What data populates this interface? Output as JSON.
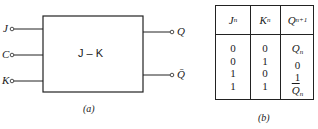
{
  "diagram_a": {
    "block_label": "J – K",
    "inputs": [
      {
        "label": "J"
      },
      {
        "label": "C"
      },
      {
        "label": "K"
      }
    ],
    "outputs": [
      {
        "label": "Q"
      },
      {
        "label": "Q̄"
      }
    ],
    "caption": "(a)"
  },
  "table_b": {
    "headers": [
      {
        "main": "J",
        "sub": "n"
      },
      {
        "main": "K",
        "sub": "n"
      },
      {
        "main": "Q",
        "sub": "n+1"
      }
    ],
    "rows": [
      {
        "j": "0",
        "k": "0",
        "q_main": "Q",
        "q_sub": "n",
        "q_bar": false
      },
      {
        "j": "0",
        "k": "1",
        "q_main": "0",
        "q_sub": "",
        "q_bar": false
      },
      {
        "j": "1",
        "k": "0",
        "q_main": "1",
        "q_sub": "",
        "q_bar": false
      },
      {
        "j": "1",
        "k": "1",
        "q_main": "Q",
        "q_sub": "n",
        "q_bar": true
      }
    ],
    "caption": "(b)"
  }
}
